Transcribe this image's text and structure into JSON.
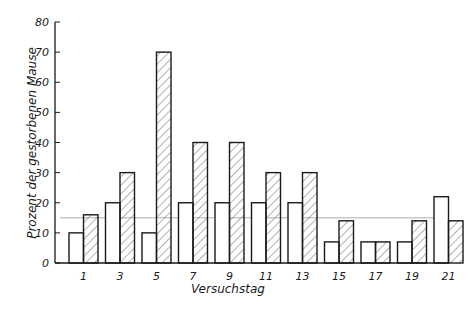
{
  "chart_data": {
    "type": "bar",
    "title": "",
    "xlabel": "Versuchstag",
    "ylabel": "Prozent der gestorbenen Mause",
    "ylim": [
      0,
      80
    ],
    "yticks": [
      0,
      10,
      20,
      30,
      40,
      50,
      60,
      70,
      80
    ],
    "grid": false,
    "legend": null,
    "categories": [
      "1",
      "3",
      "5",
      "7",
      "9",
      "11",
      "13",
      "15",
      "17",
      "19",
      "21"
    ],
    "series": [
      {
        "name": "open bars",
        "pattern": "none",
        "values": [
          10,
          20,
          10,
          20,
          20,
          20,
          20,
          7,
          7,
          7,
          22
        ]
      },
      {
        "name": "hatched bars",
        "pattern": "diagonal-hatch",
        "values": [
          16,
          30,
          70,
          40,
          40,
          30,
          30,
          14,
          7,
          14,
          14
        ]
      }
    ],
    "reference_line": {
      "value": 15,
      "style": "thin horizontal line"
    }
  },
  "colors": {
    "ink": "#1a1a1a",
    "hatch": "#555555",
    "background": "#ffffff",
    "reference": "#999999"
  }
}
